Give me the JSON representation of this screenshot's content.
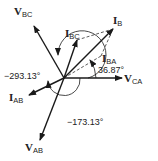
{
  "diagram": {
    "origin": [
      64,
      78
    ],
    "vectors": [
      {
        "id": "V_CA",
        "main": "V",
        "sub": "CA",
        "end": [
          122,
          78
        ],
        "style": "solid",
        "label_pos": [
          125,
          85
        ]
      },
      {
        "id": "V_BC",
        "main": "V",
        "sub": "BC",
        "end": [
          34,
          26
        ],
        "style": "solid",
        "label_pos": [
          14,
          15
        ]
      },
      {
        "id": "V_AB",
        "main": "V",
        "sub": "AB",
        "end": [
          40,
          140
        ],
        "style": "solid",
        "label_pos": [
          26,
          151
        ]
      },
      {
        "id": "I_B",
        "main": "I",
        "sub": "B",
        "end": [
          113,
          29
        ],
        "style": "solid",
        "label_pos": [
          113,
          23
        ]
      },
      {
        "id": "I_BC",
        "main": "I",
        "sub": "BC",
        "end": [
          77,
          40
        ],
        "style": "solid",
        "label_pos": [
          68,
          36
        ]
      },
      {
        "id": "I_AB",
        "main": "I",
        "sub": "AB",
        "end": [
          29,
          95
        ],
        "style": "solid",
        "label_pos": [
          8,
          102
        ]
      },
      {
        "id": "I_BA",
        "main": "I",
        "sub": "BA",
        "end": [
          101,
          56
        ],
        "style": "dashed",
        "label_pos": [
          101,
          59
        ]
      }
    ],
    "angles": [
      {
        "id": "angle-36",
        "text": "36.87°",
        "pos": [
          99,
          75
        ]
      },
      {
        "id": "angle-293",
        "text": "−293.13°",
        "pos": [
          6,
          81
        ]
      },
      {
        "id": "angle-173",
        "text": "−173.13°",
        "pos": [
          66,
          124
        ]
      }
    ],
    "colors": {
      "line": "#1a1a1a",
      "text": "#222222"
    }
  }
}
